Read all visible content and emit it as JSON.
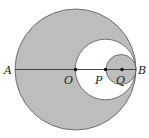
{
  "diagram": {
    "colors": {
      "shade": "#bdbdbd",
      "stroke": "#555555",
      "background": "#ffffff"
    },
    "labels": {
      "A": "A",
      "O": "O",
      "P": "P",
      "Q": "Q",
      "B": "B"
    },
    "circles": [
      {
        "name": "big-circle",
        "center": "O",
        "shaded": true
      },
      {
        "name": "middle-circle",
        "center": "P",
        "shaded": false
      },
      {
        "name": "small-circle",
        "center": "Q",
        "shaded": true
      }
    ],
    "segment": "AB"
  }
}
